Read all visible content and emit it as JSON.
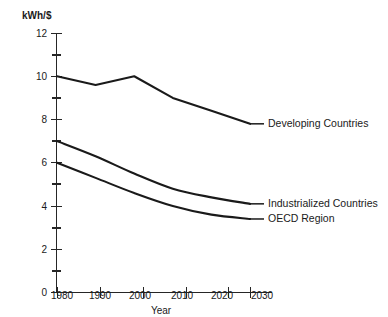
{
  "chart_data": {
    "type": "line",
    "title": "",
    "subtitle": "",
    "xlabel": "Year",
    "ylabel": "kWh/$",
    "x": [
      1980,
      1990,
      2000,
      2010,
      2020,
      2030
    ],
    "xtick_labels": [
      "1980",
      "1990",
      "2000",
      "2010",
      "2020",
      "2030"
    ],
    "xlim": [
      1980,
      2030
    ],
    "ylim": [
      0,
      12
    ],
    "ytick_labels": [
      "0",
      "2",
      "4",
      "6",
      "8",
      "10",
      "12"
    ],
    "ytick_values": [
      0,
      2,
      4,
      6,
      8,
      10,
      12
    ],
    "yminor_values": [
      1,
      3,
      5,
      7,
      9,
      11
    ],
    "grid": false,
    "legend_position": "inline-right-end-of-line",
    "series": [
      {
        "name": "Developing Countries",
        "values": [
          10.0,
          9.6,
          10.0,
          9.0,
          8.4,
          7.8
        ],
        "label": "Developing Countries",
        "label_x": 2030,
        "label_y": 7.8
      },
      {
        "name": "Industrialized Countries",
        "values": [
          7.0,
          6.3,
          5.5,
          4.8,
          4.4,
          4.1
        ],
        "label": "Industrialized Countries",
        "label_x": 2030,
        "label_y": 4.1
      },
      {
        "name": "OECD Region",
        "values": [
          6.0,
          5.3,
          4.6,
          4.0,
          3.6,
          3.4
        ],
        "label": "OECD Region",
        "label_x": 2030,
        "label_y": 3.4
      }
    ],
    "colors": {
      "line": "#1a1a1a",
      "axis": "#262626",
      "background": "#ffffff"
    }
  },
  "axes": {
    "y_axis_title": "kWh/$",
    "x_axis_title": "Year"
  },
  "y_ticks": [
    {
      "label": "12"
    },
    {
      "label": "10"
    },
    {
      "label": "8"
    },
    {
      "label": "6"
    },
    {
      "label": "4"
    },
    {
      "label": "2"
    },
    {
      "label": "0"
    }
  ],
  "x_ticks": [
    {
      "label": "1980"
    },
    {
      "label": "1990"
    },
    {
      "label": "2000"
    },
    {
      "label": "2010"
    },
    {
      "label": "2020"
    },
    {
      "label": "2030"
    }
  ],
  "series_labels": [
    {
      "label": "Developing Countries"
    },
    {
      "label": "Industrialized Countries"
    },
    {
      "label": "OECD Region"
    }
  ]
}
